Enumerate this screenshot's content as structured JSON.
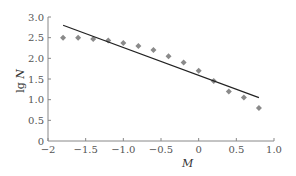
{
  "chart_data": {
    "type": "scatter",
    "title": "",
    "xlabel": "M",
    "ylabel": "lg N",
    "ylabel_prefix": "lg",
    "ylabel_var": "N",
    "xlim": [
      -2,
      1.0
    ],
    "ylim": [
      0,
      3.0
    ],
    "grid": false,
    "legend": "none",
    "x_ticks": [
      -2,
      -1.5,
      -1.0,
      -0.5,
      0,
      0.5,
      1.0
    ],
    "x_tick_labels": [
      "−2",
      "−1.5",
      "−1.0",
      "−0.5",
      "0",
      "0.5",
      "1.0"
    ],
    "y_ticks": [
      0,
      0.5,
      1.0,
      1.5,
      2.0,
      2.5,
      3.0
    ],
    "y_tick_labels": [
      "0",
      "0.5",
      "1.0",
      "1.5",
      "2.0",
      "2.5",
      "3.0"
    ],
    "series": [
      {
        "name": "observed",
        "type": "scatter",
        "marker": "diamond",
        "color": "#8a8a8a",
        "x": [
          -1.8,
          -1.6,
          -1.4,
          -1.2,
          -1.0,
          -0.8,
          -0.6,
          -0.4,
          -0.2,
          0.0,
          0.2,
          0.4,
          0.6,
          0.8
        ],
        "y": [
          2.5,
          2.5,
          2.47,
          2.43,
          2.37,
          2.3,
          2.2,
          2.05,
          1.9,
          1.7,
          1.45,
          1.2,
          1.05,
          0.8
        ]
      },
      {
        "name": "fit",
        "type": "line",
        "color": "#222222",
        "x": [
          -1.8,
          0.8
        ],
        "y": [
          2.8,
          1.05
        ]
      }
    ]
  }
}
